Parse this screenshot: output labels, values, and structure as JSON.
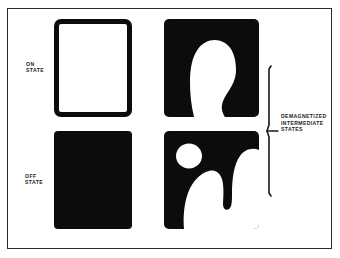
{
  "figure": {
    "background_color": "#ffffff",
    "ink_color": "#0c0c0c",
    "frame_color": "#2b2b2b"
  },
  "labels": {
    "on_state": "ON\nSTATE",
    "off_state": "OFF\nSTATE",
    "intermediate": "DEMAGNETIZED\nINTERMEDIATE\nSTATES"
  },
  "panels": [
    {
      "id": "on-state",
      "name": "on-state-panel",
      "fill": "white",
      "description": "fully white square with heavy black outline"
    },
    {
      "id": "off-state",
      "name": "off-state-panel",
      "fill": "black",
      "description": "fully black square"
    },
    {
      "id": "intermediate-top",
      "name": "intermediate-top-panel",
      "fill": "black",
      "description": "black square with one large white bulb domain reaching the bottom edge"
    },
    {
      "id": "intermediate-bottom",
      "name": "intermediate-bottom-panel",
      "fill": "black",
      "description": "black square with a white circular domain and a white forked domain"
    }
  ],
  "bracket": {
    "name": "intermediate-states-bracket",
    "orientation": "vertical",
    "points_to": "DEMAGNETIZED INTERMEDIATE STATES"
  }
}
